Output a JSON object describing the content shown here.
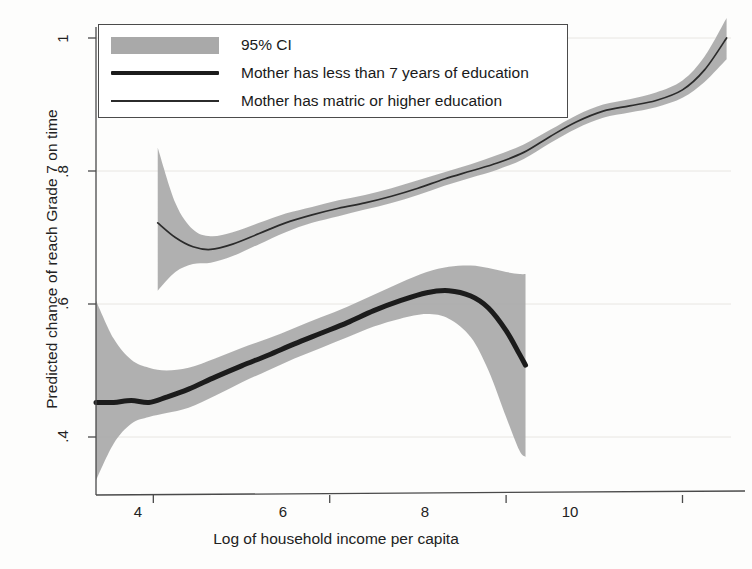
{
  "chart_data": {
    "type": "line",
    "title": "",
    "xlabel": "Log of household income per capita",
    "ylabel": "Predicted chance of reach Grade 7 on time",
    "xlim": [
      3.35,
      10.55
    ],
    "ylim": [
      0.32,
      1.03
    ],
    "xticks": [
      4,
      6,
      8,
      10
    ],
    "yticks": [
      ".4",
      ".6",
      ".8",
      "1"
    ],
    "ytick_values": [
      0.4,
      0.6,
      0.8,
      1.0
    ],
    "grid": "faint-horizontal",
    "legend_position": "top-left-inside",
    "band_color": "#a9a9a9",
    "series": [
      {
        "name": "Mother has less than 7 years of education",
        "style": "thick",
        "color": "#1c1c1c",
        "x": [
          3.35,
          3.55,
          3.75,
          3.95,
          4.15,
          4.4,
          4.7,
          5.0,
          5.3,
          5.6,
          5.9,
          6.2,
          6.5,
          6.8,
          7.1,
          7.35,
          7.6,
          7.8,
          8.0,
          8.15,
          8.22
        ],
        "y": [
          0.452,
          0.452,
          0.455,
          0.452,
          0.46,
          0.472,
          0.49,
          0.507,
          0.523,
          0.54,
          0.556,
          0.572,
          0.59,
          0.605,
          0.617,
          0.62,
          0.612,
          0.594,
          0.56,
          0.525,
          0.508
        ],
        "ci_low": [
          0.335,
          0.39,
          0.42,
          0.43,
          0.436,
          0.444,
          0.462,
          0.482,
          0.5,
          0.518,
          0.534,
          0.55,
          0.566,
          0.578,
          0.585,
          0.578,
          0.55,
          0.5,
          0.43,
          0.38,
          0.37
        ],
        "ci_high": [
          0.605,
          0.548,
          0.516,
          0.504,
          0.5,
          0.504,
          0.518,
          0.534,
          0.548,
          0.564,
          0.58,
          0.596,
          0.614,
          0.632,
          0.648,
          0.656,
          0.658,
          0.654,
          0.648,
          0.645,
          0.645
        ]
      },
      {
        "name": "Mother has matric or higher education",
        "style": "thin",
        "color": "#2b2b2b",
        "x": [
          4.05,
          4.25,
          4.45,
          4.65,
          4.9,
          5.2,
          5.5,
          5.8,
          6.1,
          6.4,
          6.7,
          7.0,
          7.3,
          7.6,
          7.9,
          8.2,
          8.5,
          8.8,
          9.1,
          9.4,
          9.7,
          10.0,
          10.25,
          10.5
        ],
        "y": [
          0.722,
          0.7,
          0.686,
          0.682,
          0.69,
          0.706,
          0.722,
          0.734,
          0.744,
          0.752,
          0.762,
          0.774,
          0.788,
          0.8,
          0.812,
          0.828,
          0.852,
          0.874,
          0.89,
          0.898,
          0.906,
          0.922,
          0.952,
          1.0
        ],
        "ci_low": [
          0.62,
          0.648,
          0.66,
          0.662,
          0.672,
          0.69,
          0.708,
          0.722,
          0.732,
          0.742,
          0.752,
          0.764,
          0.778,
          0.79,
          0.802,
          0.818,
          0.842,
          0.864,
          0.88,
          0.888,
          0.896,
          0.91,
          0.934,
          0.968
        ],
        "ci_high": [
          0.835,
          0.752,
          0.712,
          0.702,
          0.708,
          0.722,
          0.736,
          0.746,
          0.756,
          0.764,
          0.774,
          0.786,
          0.798,
          0.81,
          0.824,
          0.84,
          0.862,
          0.884,
          0.9,
          0.908,
          0.918,
          0.936,
          0.972,
          1.03
        ]
      }
    ]
  },
  "legend": {
    "items": [
      {
        "key": "band",
        "label": "95% CI"
      },
      {
        "key": "thick",
        "label": "Mother has less than 7 years of education"
      },
      {
        "key": "thin",
        "label": "Mother has matric or higher education"
      }
    ]
  },
  "axes": {
    "x_title": "Log of household income per capita",
    "y_title": "Predicted chance of reach Grade 7 on time",
    "x_tick_labels": [
      "4",
      "6",
      "8",
      "10"
    ],
    "y_tick_labels": [
      "1",
      ".8",
      ".6",
      ".4"
    ]
  }
}
